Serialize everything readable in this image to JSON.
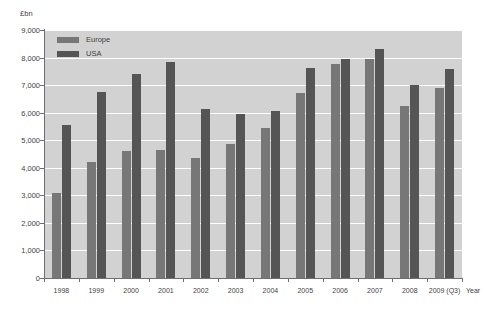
{
  "chart_data": {
    "type": "bar",
    "title": "",
    "subtitle": "",
    "xlabel": "Year",
    "ylabel": "£bn",
    "ylim": [
      0,
      9000
    ],
    "ytick_step": 1000,
    "ytick_labels": [
      "9,000",
      "8,000",
      "7,000",
      "6,000",
      "5,000",
      "4,000",
      "3,000",
      "2,000",
      "1,000",
      "0"
    ],
    "ytick_values": [
      9000,
      8000,
      7000,
      6000,
      5000,
      4000,
      3000,
      2000,
      1000,
      0
    ],
    "grid": "horizontal",
    "legend_position": "top-left-inside",
    "categories": [
      "1998",
      "1999",
      "2000",
      "2001",
      "2002",
      "2003",
      "2004",
      "2005",
      "2006",
      "2007",
      "2008",
      "2009 (Q3)"
    ],
    "series": [
      {
        "name": "Europe",
        "color": "#777777",
        "values": [
          3100,
          4200,
          4600,
          4650,
          4350,
          4850,
          5450,
          6700,
          7750,
          7950,
          6250,
          6900
        ]
      },
      {
        "name": "USA",
        "color": "#555555",
        "values": [
          5550,
          6750,
          7420,
          7850,
          6150,
          5950,
          6050,
          7620,
          7950,
          8300,
          7000,
          7580
        ]
      }
    ],
    "plot_background": "#d2d2d2",
    "gridline_color": "#ffffff",
    "axis_color": "#6f6f6f",
    "page_background": "#ffffff"
  },
  "legend": {
    "items": [
      {
        "label": "Europe",
        "color": "#777777"
      },
      {
        "label": "USA",
        "color": "#555555"
      }
    ]
  },
  "axes": {
    "y_unit": "£bn",
    "x_title": "Year"
  }
}
